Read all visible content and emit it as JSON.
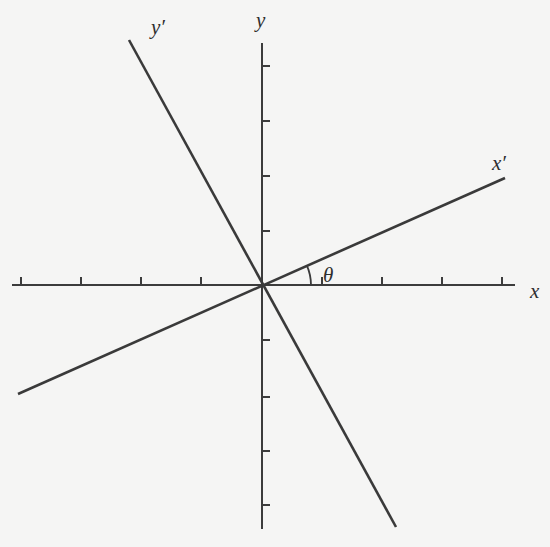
{
  "diagram": {
    "background_color": "#f5f5f4",
    "line_color": "#3a3a3a",
    "origin": [
      262,
      285
    ],
    "axes": {
      "x": {
        "label": "x",
        "start": [
          12,
          285
        ],
        "end": [
          515,
          285
        ],
        "ticks_x": [
          21,
          81,
          141,
          201,
          322,
          382,
          442,
          502
        ],
        "tick_side": "above",
        "label_pos": [
          530,
          298
        ]
      },
      "y": {
        "label": "y",
        "start": [
          262,
          43
        ],
        "end": [
          262,
          529
        ],
        "ticks_y": [
          66,
          121,
          176,
          231,
          340,
          397,
          451,
          505
        ],
        "tick_side": "right",
        "label_pos": [
          256,
          27
        ]
      }
    },
    "rotated_axes": {
      "x_prime": {
        "label": "x′",
        "start": [
          18,
          394
        ],
        "end": [
          505,
          178
        ],
        "label_pos": [
          492,
          170
        ]
      },
      "y_prime": {
        "label": "y′",
        "start": [
          129,
          40
        ],
        "end": [
          396,
          527
        ],
        "label_pos": [
          151,
          34
        ]
      }
    },
    "angle": {
      "label": "θ",
      "description": "angle between x-axis and x′-axis",
      "arc_radius": 49,
      "label_pos": [
        323,
        282
      ]
    }
  }
}
